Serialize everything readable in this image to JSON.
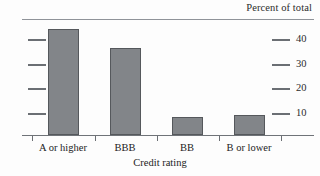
{
  "chart_data": {
    "type": "bar",
    "title": "Percent of total",
    "xlabel": "Credit rating",
    "ylabel": "",
    "categories": [
      "A or higher",
      "BBB",
      "BB",
      "B or lower"
    ],
    "values": [
      43,
      35,
      7,
      8
    ],
    "ylim": [
      0,
      45
    ],
    "yticks": [
      10,
      20,
      30,
      40
    ],
    "ytick_labels": [
      "10",
      "20",
      "30",
      "40"
    ],
    "grid": false,
    "legend": null,
    "axis_position": "right",
    "bar_color": "#828589",
    "bar_edge_color": "#55585c",
    "rule_color": "#8f9399",
    "text_color": "#1c1c1c"
  },
  "ticks": [
    {
      "label": "40",
      "value": 40,
      "top": 39
    },
    {
      "label": "30",
      "value": 30,
      "top": 64
    },
    {
      "label": "20",
      "value": 20,
      "top": 88
    },
    {
      "label": "10",
      "value": 10,
      "top": 113
    }
  ],
  "bars": [
    {
      "category": "A or higher",
      "value": 43,
      "left": 48,
      "width": 31,
      "top": 29,
      "height": 106,
      "center": 63
    },
    {
      "category": "BBB",
      "value": 35,
      "left": 110,
      "width": 31,
      "top": 48,
      "height": 87,
      "center": 125
    },
    {
      "category": "BB",
      "value": 7,
      "left": 172,
      "width": 31,
      "top": 117,
      "height": 18,
      "center": 187
    },
    {
      "category": "B or lower",
      "value": 8,
      "left": 234,
      "width": 31,
      "top": 115,
      "height": 20,
      "center": 249
    }
  ],
  "xticks": [
    32,
    95,
    157,
    219,
    281
  ]
}
